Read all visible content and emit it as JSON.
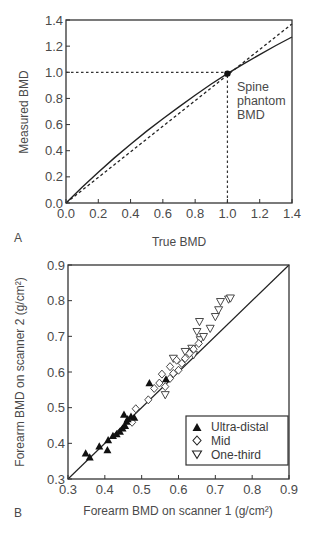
{
  "figure": {
    "panels": [
      {
        "label": "A",
        "xlabel": "True BMD",
        "ylabel": "Measured BMD",
        "xticks": [
          "0.0",
          "0.2",
          "0.4",
          "0.6",
          "0.8",
          "1.0",
          "1.2",
          "1.4"
        ],
        "yticks": [
          "0.0",
          "0.2",
          "0.4",
          "0.6",
          "0.8",
          "1.0",
          "1.2",
          "1.4"
        ],
        "annotation_lines": [
          "Spine",
          "phantom",
          "BMD"
        ]
      },
      {
        "label": "B",
        "xlabel": "Forearm BMD on scanner 1 (g/cm²)",
        "ylabel": "Forearm BMD on scanner 2 (g/cm²)",
        "xticks": [
          "0.3",
          "0.4",
          "0.5",
          "0.6",
          "0.7",
          "0.8",
          "0.9"
        ],
        "yticks": [
          "0.3",
          "0.4",
          "0.5",
          "0.6",
          "0.7",
          "0.8",
          "0.9"
        ],
        "legend": [
          {
            "label": "Ultra-distal",
            "marker": "filled-triangle-up"
          },
          {
            "label": "Mid",
            "marker": "open-diamond"
          },
          {
            "label": "One-third",
            "marker": "open-triangle-down"
          }
        ]
      }
    ]
  },
  "chart_data": [
    {
      "type": "line",
      "panel": "A",
      "title": "",
      "xlabel": "True BMD",
      "ylabel": "Measured BMD",
      "xlim": [
        0,
        1.4
      ],
      "ylim": [
        0,
        1.4
      ],
      "grid": false,
      "series": [
        {
          "name": "Measured response",
          "style": "solid",
          "x": [
            0.0,
            0.1,
            0.2,
            0.3,
            0.4,
            0.5,
            0.6,
            0.7,
            0.8,
            0.9,
            1.0,
            1.1,
            1.2,
            1.3,
            1.4
          ],
          "y": [
            0.0,
            0.12,
            0.235,
            0.345,
            0.45,
            0.55,
            0.645,
            0.735,
            0.825,
            0.91,
            0.99,
            1.065,
            1.135,
            1.205,
            1.27
          ]
        },
        {
          "name": "Line of identity",
          "style": "dashed",
          "x": [
            0.0,
            1.4
          ],
          "y": [
            0.0,
            1.37
          ]
        }
      ],
      "annotations": [
        {
          "type": "point",
          "x": 1.0,
          "y": 0.99,
          "label": "Spine phantom BMD"
        },
        {
          "type": "hline-dotted",
          "y": 1.0,
          "x_from": 0.0,
          "x_to": 1.0
        },
        {
          "type": "vline-dotted",
          "x": 1.0,
          "y_from": 0.0,
          "y_to": 1.0
        }
      ]
    },
    {
      "type": "scatter",
      "panel": "B",
      "title": "",
      "xlabel": "Forearm BMD on scanner 1 (g/cm²)",
      "ylabel": "Forearm BMD on scanner 2 (g/cm²)",
      "xlim": [
        0.3,
        0.9
      ],
      "ylim": [
        0.3,
        0.9
      ],
      "grid": false,
      "legend_position": "lower right",
      "reference_line": {
        "name": "Line of identity",
        "x": [
          0.3,
          0.9
        ],
        "y": [
          0.3,
          0.9
        ]
      },
      "series": [
        {
          "name": "Ultra-distal",
          "marker": "filled-triangle-up",
          "points": [
            [
              0.348,
              0.372
            ],
            [
              0.359,
              0.361
            ],
            [
              0.385,
              0.392
            ],
            [
              0.407,
              0.381
            ],
            [
              0.409,
              0.409
            ],
            [
              0.422,
              0.421
            ],
            [
              0.432,
              0.426
            ],
            [
              0.441,
              0.433
            ],
            [
              0.448,
              0.442
            ],
            [
              0.455,
              0.449
            ],
            [
              0.452,
              0.481
            ],
            [
              0.459,
              0.461
            ],
            [
              0.462,
              0.468
            ],
            [
              0.471,
              0.475
            ],
            [
              0.48,
              0.472
            ],
            [
              0.521,
              0.569
            ],
            [
              0.566,
              0.58
            ]
          ]
        },
        {
          "name": "Mid",
          "marker": "open-diamond",
          "points": [
            [
              0.474,
              0.459
            ],
            [
              0.484,
              0.497
            ],
            [
              0.518,
              0.522
            ],
            [
              0.534,
              0.554
            ],
            [
              0.548,
              0.569
            ],
            [
              0.555,
              0.594
            ],
            [
              0.564,
              0.559
            ],
            [
              0.577,
              0.582
            ],
            [
              0.577,
              0.615
            ],
            [
              0.586,
              0.596
            ],
            [
              0.595,
              0.633
            ],
            [
              0.6,
              0.605
            ],
            [
              0.609,
              0.624
            ],
            [
              0.618,
              0.638
            ],
            [
              0.63,
              0.652
            ],
            [
              0.641,
              0.664
            ],
            [
              0.655,
              0.68
            ]
          ]
        },
        {
          "name": "One-third",
          "marker": "open-triangle-down",
          "points": [
            [
              0.564,
              0.536
            ],
            [
              0.586,
              0.638
            ],
            [
              0.618,
              0.657
            ],
            [
              0.636,
              0.666
            ],
            [
              0.641,
              0.648
            ],
            [
              0.65,
              0.713
            ],
            [
              0.657,
              0.741
            ],
            [
              0.659,
              0.69
            ],
            [
              0.668,
              0.699
            ],
            [
              0.686,
              0.722
            ],
            [
              0.7,
              0.755
            ],
            [
              0.709,
              0.774
            ],
            [
              0.714,
              0.797
            ],
            [
              0.736,
              0.804
            ],
            [
              0.741,
              0.807
            ]
          ]
        }
      ]
    }
  ]
}
